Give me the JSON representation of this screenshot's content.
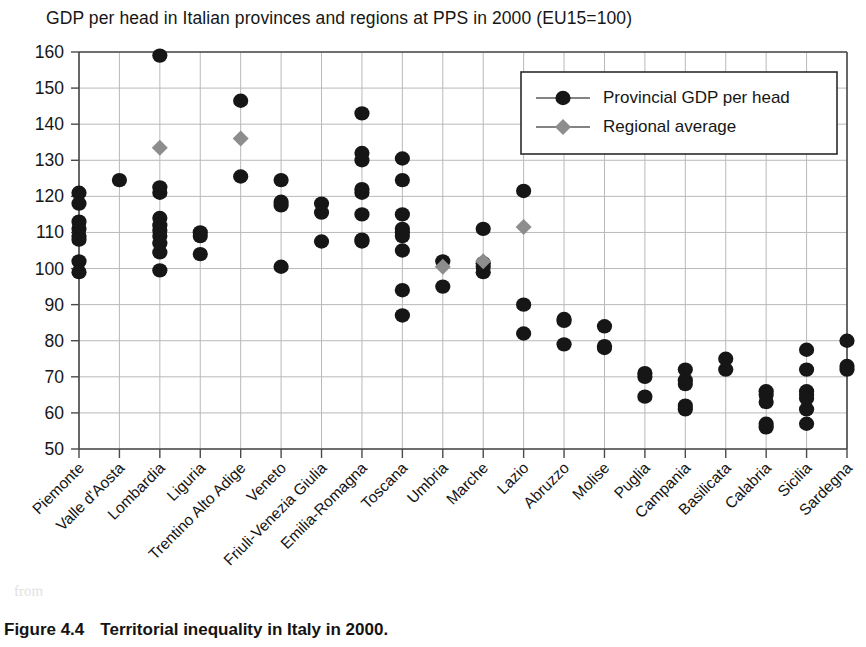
{
  "chart_data": {
    "type": "scatter",
    "title": "GDP per head in Italian provinces and regions at PPS in 2000 (EU15=100)",
    "caption_number": "Figure 4.4",
    "caption_text": "Territorial inequality in Italy in 2000.",
    "xlabel": "",
    "ylabel": "",
    "ylim": [
      50,
      160
    ],
    "ytick_step": 10,
    "yticks": [
      50,
      60,
      70,
      80,
      90,
      100,
      110,
      120,
      130,
      140,
      150,
      160
    ],
    "grid": true,
    "legend_position": "top-right",
    "legend": [
      {
        "name": "Provincial GDP per head",
        "marker": "circle",
        "color": "#161616"
      },
      {
        "name": "Regional average",
        "marker": "diamond",
        "color": "#8d8d8d"
      }
    ],
    "categories": [
      "Piemonte",
      "Valle d'Aosta",
      "Lombardia",
      "Liguria",
      "Trentino Alto Adige",
      "Veneto",
      "Friuli-Venezia Giulia",
      "Emilia-Romagna",
      "Toscana",
      "Umbria",
      "Marche",
      "Lazio",
      "Abruzzo",
      "Molise",
      "Puglia",
      "Campania",
      "Basilicata",
      "Calabria",
      "Sicilia",
      "Sardegna"
    ],
    "series": [
      {
        "name": "Provincial GDP per head",
        "marker": "circle",
        "color": "#161616",
        "values_by_category": [
          [
            121,
            118,
            113,
            111,
            109,
            108,
            102,
            99
          ],
          [
            124.5
          ],
          [
            159,
            122.5,
            121,
            114,
            112,
            110.5,
            109,
            107,
            104.5,
            99.5
          ],
          [
            110,
            109,
            104
          ],
          [
            146.5,
            125.5
          ],
          [
            124.5,
            118.5,
            117.5,
            100.5
          ],
          [
            118,
            115.5,
            107.5
          ],
          [
            143,
            132,
            130,
            122,
            121,
            115,
            108,
            107.5
          ],
          [
            130.5,
            124.5,
            115,
            111,
            110,
            109,
            105,
            94,
            87
          ],
          [
            102,
            95
          ],
          [
            111,
            101.5,
            100.5,
            99
          ],
          [
            121.5,
            90,
            82
          ],
          [
            86,
            85.5,
            79
          ],
          [
            84,
            78.5,
            78
          ],
          [
            71,
            70,
            64.5
          ],
          [
            72,
            69,
            68,
            62,
            61
          ],
          [
            75,
            72
          ],
          [
            66,
            65,
            63,
            57,
            56
          ],
          [
            77.5,
            72,
            66,
            65,
            64,
            61,
            57
          ],
          [
            80,
            73,
            72
          ]
        ]
      },
      {
        "name": "Regional average",
        "marker": "diamond",
        "color": "#8d8d8d",
        "values_by_category": [
          null,
          null,
          133.5,
          null,
          136,
          null,
          null,
          null,
          null,
          100.5,
          102,
          111.5,
          null,
          null,
          null,
          null,
          null,
          null,
          null,
          null
        ]
      }
    ]
  }
}
